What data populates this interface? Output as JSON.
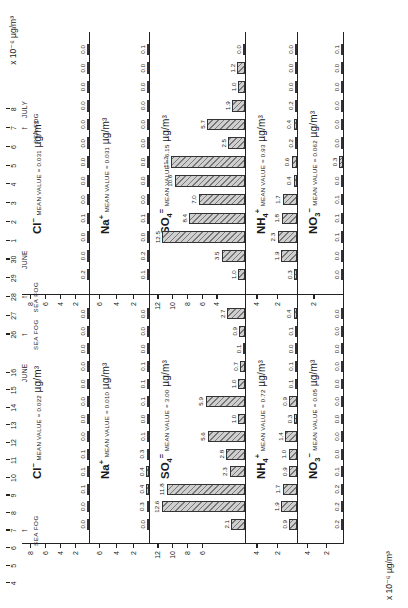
{
  "figure": {
    "axis_titles": {
      "top_right": "x 10⁻⁶ µg/m³",
      "bottom_left": "x 10⁻⁶ µg/m³",
      "unit_main": "µg/m³"
    }
  },
  "panels": [
    {
      "id": "cl-left",
      "species": "Cl",
      "charge": "−",
      "mean_label": "MEAN VALUE = 0.022",
      "unit": "µg/m³",
      "unit_prefix": "",
      "yticks": [
        2,
        4,
        6,
        8
      ],
      "ymax": 9.0,
      "values": [
        "0.0",
        "0.0",
        "0.1",
        "0.1",
        "0.1",
        "0.0",
        "0.0",
        "0.0",
        "0.0",
        "0.0",
        "0.0",
        "0.0",
        "0.0",
        "0.0",
        "0.0",
        "0.0",
        "0.0",
        "0.0",
        "0.0",
        "0.0",
        "0.0",
        "0.0",
        "0.0",
        "0.0"
      ]
    },
    {
      "id": "na-left",
      "species": "Na",
      "charge": "+",
      "mean_label": "MEAN VALUE = 0.010",
      "unit": "µg/m³",
      "yticks": [
        2,
        4,
        6
      ],
      "ymax": 7.0,
      "values": [
        "0.0",
        "0.3",
        "0.4",
        "0.4",
        "0.3",
        "0.1",
        "0.0",
        "0.1",
        "0.1",
        "0.1",
        "0.0",
        "0.0",
        "0.0",
        "0.0",
        "0.1",
        "0.0",
        "0.0",
        "0.0",
        "0.0",
        "0.0",
        "0.0",
        "0.0",
        "0.0",
        "0.0"
      ]
    },
    {
      "id": "so4-left",
      "species": "SO",
      "sub": "4",
      "charge": "=",
      "mean_label": "MEAN VALUE = 3.00",
      "unit": "µg/m³",
      "yticks": [
        6,
        8,
        10,
        12
      ],
      "ymax": 13.0,
      "values": [
        "2.1",
        "12.6",
        "11.8",
        "2.3",
        "2.8",
        "5.6",
        "1.0",
        "5.9",
        "1.0",
        "0.7",
        "0.1",
        "0.9",
        "2.7",
        "1.4",
        "",
        "",
        "",
        "",
        "",
        "",
        "",
        "",
        "",
        ""
      ],
      "values_display": [
        "2.1",
        "",
        "",
        "2.3",
        "2.8",
        "5.6",
        "1.0",
        "5.9",
        "1.0",
        "0.7",
        "0.1",
        "0.9",
        "2.7",
        "1.4"
      ]
    },
    {
      "id": "nh4-left",
      "species": "NH",
      "sub": "4",
      "charge": "+",
      "mean_label": "MEAN VALUE = 0.72",
      "unit": "µg/m³",
      "yticks": [
        2,
        4
      ],
      "ymax": 5.0,
      "values": [
        "0.9",
        "1.9",
        "1.7",
        "0.9",
        "1.0",
        "1.4",
        "0.3",
        "0.9",
        "0.1",
        "0.1",
        "0.0",
        "0.1",
        "0.4",
        "0.3",
        "0.7"
      ]
    },
    {
      "id": "no3-left",
      "species": "NO",
      "sub": "3",
      "charge": "−",
      "mean_label": "MEAN VALUE = 0.05",
      "unit": "µg/m³",
      "yticks": [
        2,
        4
      ],
      "ymax": 5.0,
      "values": [
        "0.2",
        "0.2",
        "0.2",
        "0.1",
        "0.0",
        "0.0",
        "0.0",
        "0.0",
        "0.0",
        "0.0",
        "0.0",
        "0.0",
        "0.0",
        "0.0",
        "0.0"
      ]
    },
    {
      "id": "cl-right",
      "species": "Cl",
      "charge": "−",
      "mean_label": "MEAN VALUE = 0.031",
      "unit": "µg/m³",
      "yticks": [
        2,
        4,
        6,
        8
      ],
      "ymax": 9.0,
      "values": [
        "0.2",
        "0.0",
        "0.0",
        "0.1",
        "0.0",
        "0.0",
        "0.0",
        "0.0",
        "0.0",
        "0.0",
        "0.0",
        "0.0",
        "0.0"
      ]
    },
    {
      "id": "na-right",
      "species": "Na",
      "charge": "+",
      "mean_label": "MEAN VALUE = 0.031",
      "unit": "µg/m³",
      "yticks": [
        2,
        4,
        6
      ],
      "ymax": 7.0,
      "values": [
        "0.1",
        "0.2",
        "0.0",
        "0.1",
        "0.0",
        "0.0",
        "0.0",
        "0.0",
        "0.0",
        "0.0",
        "0.0",
        "0.0",
        "0.1"
      ]
    },
    {
      "id": "so4-right",
      "species": "SO",
      "sub": "4",
      "charge": "=",
      "mean_label": "MEAN VALUE = 6.15",
      "unit": "µg/m³",
      "yticks": [
        4,
        6,
        8,
        10,
        12
      ],
      "ymax": 13.0,
      "values": [
        "1.0",
        "3.5",
        "12.5",
        "8.4",
        "7.0",
        "10.6",
        "11.2",
        "2.5",
        "5.7",
        "1.9",
        "1.0",
        "1.2"
      ]
    },
    {
      "id": "nh4-right",
      "species": "NH",
      "sub": "4",
      "charge": "+",
      "mean_label": "MEAN VALUE = 0.93",
      "unit": "µg/m³",
      "yticks": [
        2,
        4
      ],
      "ymax": 5.0,
      "values": [
        "0.3",
        "1.9",
        "2.3",
        "1.8",
        "1.7",
        "0.4",
        "0.6",
        "0.2",
        "0.4",
        "0.2"
      ]
    },
    {
      "id": "no3-right",
      "species": "NO",
      "sub": "3",
      "charge": "−",
      "mean_label": "MEAN VALUE = 0.062",
      "unit": "µg/m³",
      "yticks": [
        2
      ],
      "ymax": 3.0,
      "values": [
        "0.0",
        "0.0",
        "0.1",
        "0.1",
        "0.1",
        "0.0",
        "0.3",
        "0.0",
        "0.0",
        "0.0",
        "0.0",
        "0.0",
        "0.1"
      ]
    }
  ],
  "date_axis": {
    "left": {
      "labels": [
        "4",
        "5",
        "6",
        "7",
        "8",
        "9",
        "10",
        "11",
        "12",
        "13",
        "14",
        "15",
        "16"
      ],
      "month": "JUNE",
      "month_at": "16",
      "fog_marks": [
        {
          "at": "7",
          "label": "SEA FOG"
        }
      ]
    },
    "right": {
      "labels": [
        "26",
        "27",
        "28",
        "29",
        "30",
        "1",
        "2",
        "3",
        "4",
        "5",
        "6",
        "7",
        "8"
      ],
      "months": [
        {
          "label": "JUNE",
          "at": "30"
        },
        {
          "label": "JULY",
          "at": "8"
        }
      ],
      "fog_marks": [
        {
          "at": "26",
          "label": "SEA FOG"
        },
        {
          "at": "28",
          "label": "SEA FOG"
        },
        {
          "at": "7",
          "label": "SEA FOG"
        }
      ]
    }
  },
  "chart_data": {
    "type": "bar",
    "title": "",
    "xlabel": "",
    "ylabel": "µg/m³",
    "grid": false,
    "legend": "none",
    "note": "Ten stacked bar panels: five ionic species (Cl⁻, Na⁺, SO₄⁼, NH₄⁺, NO₃⁻) plotted over two date ranges. Left block = June 4-16, right block = June 26 - July 8. Cl⁻ and Na⁺ use a x10⁻⁶ µg/m³ scale; SO₄⁼, NH₄⁺, NO₃⁻ use µg/m³.",
    "panels": [
      {
        "name": "Cl- (June 4-16)",
        "unit": "µg/m³",
        "mean": 0.022,
        "ylim": [
          0,
          9
        ],
        "x": [
          "4",
          "5",
          "6",
          "7",
          "8",
          "9",
          "10",
          "11",
          "12",
          "13",
          "14",
          "15",
          "16"
        ],
        "values": [
          0.0,
          0.1,
          0.1,
          0.1,
          0.0,
          0.0,
          0.0,
          0.0,
          0.0,
          0.0,
          0.0,
          0.0,
          0.0
        ]
      },
      {
        "name": "Na+ (June 4-16)",
        "unit": "µg/m³",
        "mean": 0.01,
        "ylim": [
          0,
          7
        ],
        "x": [
          "4",
          "5",
          "6",
          "7",
          "8",
          "9",
          "10",
          "11",
          "12",
          "13",
          "14",
          "15",
          "16"
        ],
        "values": [
          0.0,
          0.3,
          0.4,
          0.4,
          0.3,
          0.1,
          0.1,
          0.1,
          0.0,
          0.0,
          0.0,
          0.1,
          0.0
        ]
      },
      {
        "name": "SO4= (June 4-16)",
        "unit": "µg/m³",
        "mean": 3.0,
        "ylim": [
          0,
          13
        ],
        "x": [
          "4",
          "5",
          "6",
          "7",
          "8",
          "9",
          "10",
          "11",
          "12",
          "13",
          "14",
          "15",
          "16"
        ],
        "values": [
          2.1,
          12.6,
          11.8,
          2.3,
          2.8,
          5.6,
          1.0,
          5.9,
          1.0,
          0.7,
          0.1,
          0.9,
          2.7
        ]
      },
      {
        "name": "NH4+ (June 4-16)",
        "unit": "µg/m³",
        "mean": 0.72,
        "ylim": [
          0,
          5
        ],
        "x": [
          "4",
          "5",
          "6",
          "7",
          "8",
          "9",
          "10",
          "11",
          "12",
          "13",
          "14",
          "15",
          "16"
        ],
        "values": [
          0.9,
          1.9,
          1.7,
          0.9,
          1.0,
          1.4,
          0.3,
          0.9,
          0.1,
          0.1,
          0.0,
          0.1,
          0.4
        ]
      },
      {
        "name": "NO3- (June 4-16)",
        "unit": "µg/m³",
        "mean": 0.05,
        "ylim": [
          0,
          5
        ],
        "x": [
          "4",
          "5",
          "6",
          "7",
          "8",
          "9",
          "10",
          "11",
          "12",
          "13",
          "14",
          "15",
          "16"
        ],
        "values": [
          0.2,
          0.2,
          0.2,
          0.1,
          0.0,
          0.0,
          0.0,
          0.0,
          0.0,
          0.0,
          0.0,
          0.0,
          0.0
        ]
      },
      {
        "name": "Cl- (June 26 - July 8)",
        "unit": "µg/m³",
        "mean": 0.031,
        "ylim": [
          0,
          9
        ],
        "x": [
          "26",
          "27",
          "28",
          "29",
          "30",
          "1",
          "2",
          "3",
          "4",
          "5",
          "6",
          "7",
          "8"
        ],
        "values": [
          0.2,
          0.0,
          0.0,
          0.1,
          0.0,
          0.0,
          0.0,
          0.0,
          0.0,
          0.0,
          0.0,
          0.0,
          0.0
        ]
      },
      {
        "name": "Na+ (June 26 - July 8)",
        "unit": "µg/m³",
        "mean": 0.031,
        "ylim": [
          0,
          7
        ],
        "x": [
          "26",
          "27",
          "28",
          "29",
          "30",
          "1",
          "2",
          "3",
          "4",
          "5",
          "6",
          "7",
          "8"
        ],
        "values": [
          0.1,
          0.2,
          0.0,
          0.1,
          0.0,
          0.0,
          0.0,
          0.0,
          0.0,
          0.0,
          0.0,
          0.0,
          0.1
        ]
      },
      {
        "name": "SO4= (June 26 - July 8)",
        "unit": "µg/m³",
        "mean": 6.15,
        "ylim": [
          0,
          13
        ],
        "x": [
          "26",
          "27",
          "28",
          "29",
          "30",
          "1",
          "2",
          "3",
          "4",
          "5",
          "6",
          "7",
          "8"
        ],
        "values": [
          1.0,
          3.5,
          12.5,
          8.4,
          7.0,
          10.6,
          11.2,
          2.5,
          5.7,
          1.9,
          1.0,
          1.2,
          0.0
        ]
      },
      {
        "name": "NH4+ (June 26 - July 8)",
        "unit": "µg/m³",
        "mean": 0.93,
        "ylim": [
          0,
          5
        ],
        "x": [
          "26",
          "27",
          "28",
          "29",
          "30",
          "1",
          "2",
          "3",
          "4",
          "5",
          "6",
          "7",
          "8"
        ],
        "values": [
          0.3,
          1.9,
          2.3,
          1.8,
          1.7,
          0.4,
          0.6,
          0.2,
          0.4,
          0.2,
          0.0,
          0.0,
          0.0
        ]
      },
      {
        "name": "NO3- (June 26 - July 8)",
        "unit": "µg/m³",
        "mean": 0.062,
        "ylim": [
          0,
          3
        ],
        "x": [
          "26",
          "27",
          "28",
          "29",
          "30",
          "1",
          "2",
          "3",
          "4",
          "5",
          "6",
          "7",
          "8"
        ],
        "values": [
          0.0,
          0.0,
          0.1,
          0.1,
          0.1,
          0.0,
          0.3,
          0.0,
          0.0,
          0.0,
          0.1,
          0.0,
          0.1
        ]
      }
    ]
  }
}
